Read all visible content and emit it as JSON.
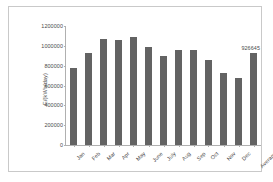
{
  "chart_data": {
    "type": "bar",
    "title": "",
    "subtitle": "",
    "xlabel": "",
    "ylabel": "E/(kWh/day)",
    "categories": [
      "Jan",
      "Feb",
      "Mar",
      "Apr",
      "May",
      "June",
      "July",
      "Aug",
      "Sep",
      "Oct",
      "Nov",
      "Dec",
      "Average"
    ],
    "values": [
      780000,
      930000,
      1070000,
      1060000,
      1085000,
      990000,
      900000,
      955000,
      960000,
      855000,
      725000,
      680000,
      926645
    ],
    "point_labels": [
      "",
      "",
      "",
      "",
      "",
      "",
      "",
      "",
      "",
      "",
      "",
      "",
      "926645"
    ],
    "ylim": [
      0,
      1200000
    ],
    "ytick_labels": [
      "1200000",
      "1000000",
      "800000",
      "600000",
      "400000",
      "200000",
      "0"
    ],
    "ytick_values": [
      1200000,
      1000000,
      800000,
      600000,
      400000,
      200000,
      0
    ],
    "grid": false,
    "legend": false,
    "legend_position": "none",
    "series_color": "#636363",
    "axis_color": "#b0b0b0",
    "text_color": "#4a4a4a",
    "border_color": "#c9c9c9",
    "background": "#ffffff"
  }
}
